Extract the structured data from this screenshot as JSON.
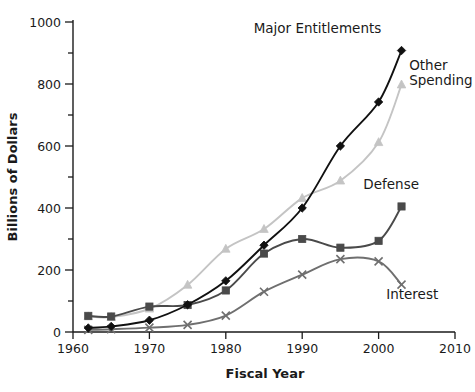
{
  "chart_data": {
    "type": "line",
    "title": "",
    "xlabel": "Fiscal Year",
    "ylabel": "Billions of Dollars",
    "xlim": [
      1960,
      2010
    ],
    "ylim": [
      0,
      1000
    ],
    "x_ticks": [
      1960,
      1970,
      1980,
      1990,
      2000,
      2010
    ],
    "y_ticks": [
      0,
      200,
      400,
      600,
      800,
      1000
    ],
    "y_minor_ticks": [
      100,
      300,
      500,
      700,
      900
    ],
    "grid": false,
    "legend_position": "inline-labels",
    "x": [
      1962,
      1965,
      1970,
      1975,
      1980,
      1985,
      1990,
      1995,
      2000,
      2003
    ],
    "series": [
      {
        "name": "Major Entitlements",
        "marker": "diamond",
        "color": "#111111",
        "label_x": 1992,
        "label_y": 965,
        "values": [
          13,
          18,
          38,
          88,
          165,
          280,
          400,
          600,
          742,
          908
        ]
      },
      {
        "name": "Other Spending",
        "marker": "triangle",
        "color": "#c4c4c4",
        "label_x": 2004,
        "label_y": 845,
        "values": [
          50,
          48,
          75,
          152,
          268,
          332,
          432,
          488,
          612,
          798
        ]
      },
      {
        "name": "Defense",
        "marker": "square",
        "color": "#4a4a4a",
        "label_x": 1998,
        "label_y": 460,
        "values": [
          52,
          50,
          82,
          87,
          134,
          253,
          300,
          272,
          294,
          405
        ]
      },
      {
        "name": "Interest",
        "marker": "x",
        "color": "#6f6f6f",
        "label_x": 2001,
        "label_y": 105,
        "values": [
          7,
          9,
          14,
          23,
          53,
          130,
          185,
          235,
          228,
          153
        ]
      }
    ]
  }
}
